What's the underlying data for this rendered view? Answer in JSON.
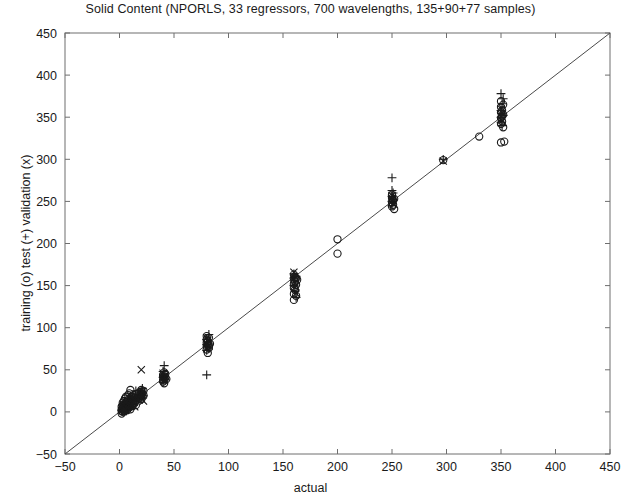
{
  "chart_data": {
    "type": "scatter",
    "title": "Solid Content (NPORLS, 33 regressors, 700 wavelengths, 135+90+77 samples)",
    "xlabel": "actual",
    "ylabel": "training (o) test (+) validation (x)",
    "xlim": [
      -50,
      450
    ],
    "ylim": [
      -50,
      450
    ],
    "xticks": [
      -50,
      0,
      50,
      100,
      150,
      200,
      250,
      300,
      350,
      400,
      450
    ],
    "yticks": [
      -50,
      0,
      50,
      100,
      150,
      200,
      250,
      300,
      350,
      400,
      450
    ],
    "grid": false,
    "legend_position": "none",
    "reference_line": {
      "label": "y = x identity line",
      "from": [
        -50,
        -50
      ],
      "to": [
        450,
        450
      ]
    },
    "series": [
      {
        "name": "training (o)",
        "marker": "o",
        "color": "#1a1a1a",
        "points": [
          [
            2,
            1
          ],
          [
            2,
            3
          ],
          [
            2,
            6
          ],
          [
            2,
            -2
          ],
          [
            3,
            4
          ],
          [
            3,
            8
          ],
          [
            3,
            0
          ],
          [
            3,
            11
          ],
          [
            4,
            2
          ],
          [
            4,
            7
          ],
          [
            4,
            13
          ],
          [
            5,
            5
          ],
          [
            5,
            9
          ],
          [
            5,
            1
          ],
          [
            5,
            16
          ],
          [
            6,
            3
          ],
          [
            6,
            10
          ],
          [
            6,
            18
          ],
          [
            7,
            6
          ],
          [
            7,
            12
          ],
          [
            7,
            2
          ],
          [
            8,
            8
          ],
          [
            8,
            14
          ],
          [
            8,
            20
          ],
          [
            9,
            5
          ],
          [
            9,
            11
          ],
          [
            9,
            22
          ],
          [
            10,
            9
          ],
          [
            10,
            15
          ],
          [
            10,
            26
          ],
          [
            10,
            3
          ],
          [
            11,
            12
          ],
          [
            11,
            18
          ],
          [
            12,
            10
          ],
          [
            12,
            16
          ],
          [
            12,
            7
          ],
          [
            13,
            13
          ],
          [
            13,
            20
          ],
          [
            14,
            11
          ],
          [
            14,
            17
          ],
          [
            15,
            14
          ],
          [
            15,
            21
          ],
          [
            15,
            8
          ],
          [
            18,
            17
          ],
          [
            18,
            23
          ],
          [
            19,
            20
          ],
          [
            20,
            19
          ],
          [
            20,
            24
          ],
          [
            20,
            15
          ],
          [
            20,
            21
          ],
          [
            20,
            26
          ],
          [
            21,
            22
          ],
          [
            22,
            20
          ],
          [
            22,
            25
          ],
          [
            40,
            38
          ],
          [
            40,
            42
          ],
          [
            40,
            36
          ],
          [
            40,
            44
          ],
          [
            41,
            40
          ],
          [
            41,
            47
          ],
          [
            41,
            34
          ],
          [
            42,
            41
          ],
          [
            42,
            45
          ],
          [
            43,
            39
          ],
          [
            80,
            78
          ],
          [
            80,
            82
          ],
          [
            80,
            86
          ],
          [
            80,
            74
          ],
          [
            80,
            90
          ],
          [
            81,
            80
          ],
          [
            81,
            84
          ],
          [
            81,
            70
          ],
          [
            82,
            79
          ],
          [
            82,
            88
          ],
          [
            82,
            76
          ],
          [
            83,
            81
          ],
          [
            160,
            158
          ],
          [
            160,
            163
          ],
          [
            160,
            152
          ],
          [
            160,
            147
          ],
          [
            160,
            140
          ],
          [
            160,
            133
          ],
          [
            161,
            160
          ],
          [
            161,
            155
          ],
          [
            161,
            145
          ],
          [
            162,
            159
          ],
          [
            162,
            151
          ],
          [
            162,
            138
          ],
          [
            163,
            157
          ],
          [
            200,
            205
          ],
          [
            200,
            188
          ],
          [
            250,
            249
          ],
          [
            250,
            254
          ],
          [
            250,
            244
          ],
          [
            250,
            258
          ],
          [
            251,
            251
          ],
          [
            251,
            246
          ],
          [
            252,
            253
          ],
          [
            252,
            241
          ],
          [
            297,
            299
          ],
          [
            330,
            327
          ],
          [
            350,
            349
          ],
          [
            350,
            356
          ],
          [
            350,
            362
          ],
          [
            350,
            342
          ],
          [
            350,
            369
          ],
          [
            351,
            351
          ],
          [
            351,
            358
          ],
          [
            351,
            345
          ],
          [
            352,
            353
          ],
          [
            352,
            365
          ],
          [
            352,
            338
          ],
          [
            353,
            321
          ],
          [
            350,
            320
          ]
        ]
      },
      {
        "name": "test (+)",
        "marker": "+",
        "color": "#1a1a1a",
        "points": [
          [
            2,
            2
          ],
          [
            3,
            5
          ],
          [
            3,
            9
          ],
          [
            4,
            3
          ],
          [
            5,
            7
          ],
          [
            5,
            12
          ],
          [
            6,
            1
          ],
          [
            7,
            9
          ],
          [
            8,
            4
          ],
          [
            8,
            16
          ],
          [
            9,
            13
          ],
          [
            10,
            6
          ],
          [
            10,
            19
          ],
          [
            11,
            10
          ],
          [
            12,
            14
          ],
          [
            13,
            8
          ],
          [
            14,
            18
          ],
          [
            15,
            12
          ],
          [
            15,
            25
          ],
          [
            18,
            20
          ],
          [
            20,
            17
          ],
          [
            20,
            23
          ],
          [
            21,
            28
          ],
          [
            22,
            19
          ],
          [
            40,
            41
          ],
          [
            40,
            48
          ],
          [
            40,
            35
          ],
          [
            41,
            55
          ],
          [
            41,
            44
          ],
          [
            42,
            38
          ],
          [
            80,
            80
          ],
          [
            80,
            86
          ],
          [
            80,
            73
          ],
          [
            81,
            83
          ],
          [
            81,
            77
          ],
          [
            82,
            92
          ],
          [
            80,
            44
          ],
          [
            160,
            159
          ],
          [
            160,
            164
          ],
          [
            160,
            150
          ],
          [
            161,
            156
          ],
          [
            161,
            143
          ],
          [
            162,
            161
          ],
          [
            162,
            136
          ],
          [
            250,
            250
          ],
          [
            250,
            256
          ],
          [
            250,
            245
          ],
          [
            251,
            252
          ],
          [
            251,
            260
          ],
          [
            250,
            278
          ],
          [
            250,
            263
          ],
          [
            297,
            300
          ],
          [
            350,
            350
          ],
          [
            350,
            358
          ],
          [
            350,
            344
          ],
          [
            351,
            354
          ],
          [
            351,
            366
          ],
          [
            351,
            340
          ],
          [
            352,
            352
          ],
          [
            352,
            372
          ],
          [
            350,
            378
          ]
        ]
      },
      {
        "name": "validation (x)",
        "marker": "x",
        "color": "#1a1a1a",
        "points": [
          [
            2,
            4
          ],
          [
            3,
            2
          ],
          [
            4,
            8
          ],
          [
            5,
            3
          ],
          [
            6,
            11
          ],
          [
            7,
            5
          ],
          [
            8,
            10
          ],
          [
            9,
            7
          ],
          [
            10,
            13
          ],
          [
            11,
            8
          ],
          [
            12,
            17
          ],
          [
            13,
            11
          ],
          [
            14,
            6
          ],
          [
            15,
            19
          ],
          [
            18,
            14
          ],
          [
            20,
            22
          ],
          [
            20,
            16
          ],
          [
            21,
            24
          ],
          [
            22,
            13
          ],
          [
            20,
            50
          ],
          [
            40,
            40
          ],
          [
            40,
            46
          ],
          [
            41,
            37
          ],
          [
            42,
            43
          ],
          [
            80,
            81
          ],
          [
            80,
            88
          ],
          [
            80,
            75
          ],
          [
            81,
            85
          ],
          [
            82,
            78
          ],
          [
            160,
            158
          ],
          [
            160,
            166
          ],
          [
            161,
            153
          ],
          [
            161,
            148
          ],
          [
            162,
            141
          ],
          [
            250,
            251
          ],
          [
            250,
            257
          ],
          [
            251,
            247
          ],
          [
            297,
            298
          ],
          [
            350,
            351
          ],
          [
            350,
            360
          ],
          [
            351,
            346
          ],
          [
            351,
            355
          ]
        ]
      }
    ]
  }
}
